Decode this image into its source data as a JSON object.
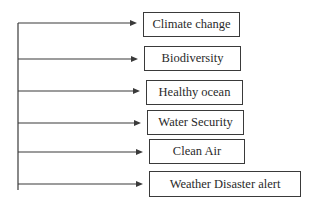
{
  "diagram": {
    "type": "bracket-flow",
    "items": [
      {
        "label": "Climate change",
        "x": 143,
        "y": 12,
        "w": 97,
        "h": 25,
        "arrow_y": 23
      },
      {
        "label": "Biodiversity",
        "x": 144,
        "y": 46,
        "w": 97,
        "h": 25,
        "arrow_y": 59
      },
      {
        "label": "Healthy ocean",
        "x": 146,
        "y": 80,
        "w": 97,
        "h": 25,
        "arrow_y": 91
      },
      {
        "label": "Water Security",
        "x": 147,
        "y": 110,
        "w": 97,
        "h": 25,
        "arrow_y": 123
      },
      {
        "label": "Clean Air",
        "x": 149,
        "y": 139,
        "w": 96,
        "h": 25,
        "arrow_y": 152
      },
      {
        "label": "Weather Disaster alert",
        "x": 149,
        "y": 171,
        "w": 152,
        "h": 26,
        "arrow_y": 184
      }
    ],
    "trunk": {
      "x": 18,
      "y1": 23,
      "y2": 190
    },
    "colors": {
      "line": "#3a3a3a",
      "text": "#2a2a2a"
    }
  }
}
